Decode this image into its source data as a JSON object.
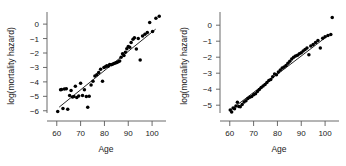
{
  "figure": {
    "background": "#ffffff",
    "point_color": "#000000",
    "line_color": "#000000",
    "axis_color": "#5a5a5a"
  },
  "chart_data": [
    {
      "type": "scatter",
      "panel": "left",
      "title": "",
      "xlabel": "Age",
      "ylabel": "log(mortality hazard)",
      "xlim": [
        58,
        105
      ],
      "ylim": [
        -6.5,
        0.7
      ],
      "xticks": [
        60,
        70,
        80,
        90,
        100
      ],
      "xticklabels": [
        "60",
        "70",
        "80",
        "90",
        "100"
      ],
      "yticks": [
        0,
        -1,
        -2,
        -3,
        -4,
        -5,
        -6
      ],
      "yticklabels": [
        "0",
        "-1",
        "-2",
        "-3",
        "-4",
        "-5",
        "-6"
      ],
      "grid": false,
      "legend": null,
      "fit_line": {
        "x": [
          61.0,
          101.5
        ],
        "y": [
          -5.75,
          -0.35
        ],
        "slope": 0.1333,
        "intercept": -13.88
      },
      "x": [
        60.4,
        61.6,
        62.0,
        62.6,
        63.2,
        64.0,
        64.6,
        65.4,
        66.0,
        66.6,
        67.2,
        67.8,
        68.4,
        69.2,
        70.0,
        70.8,
        71.6,
        72.4,
        73.0,
        73.6,
        74.4,
        75.2,
        76.0,
        76.8,
        77.6,
        78.4,
        79.2,
        79.8,
        80.4,
        81.0,
        81.6,
        82.2,
        82.8,
        83.4,
        84.0,
        84.6,
        85.2,
        85.8,
        86.4,
        87.0,
        87.6,
        88.2,
        88.8,
        89.4,
        90.0,
        90.6,
        91.2,
        92.0,
        92.6,
        93.4,
        94.2,
        95.0,
        96.0,
        97.0,
        98.0,
        99.0,
        100.2,
        101.6,
        103.0
      ],
      "y": [
        -6.05,
        -4.55,
        -4.52,
        -5.85,
        -4.5,
        -4.48,
        -5.9,
        -4.95,
        -4.6,
        -5.05,
        -5.02,
        -4.3,
        -5.08,
        -4.98,
        -4.1,
        -4.95,
        -4.55,
        -5.02,
        -5.75,
        -5.0,
        -4.22,
        -3.95,
        -3.6,
        -3.5,
        -3.35,
        -3.12,
        -3.95,
        -3.0,
        -2.95,
        -2.88,
        -2.92,
        -2.8,
        -2.82,
        -2.78,
        -2.72,
        -2.7,
        -2.66,
        -2.6,
        -2.55,
        -2.3,
        -2.05,
        -2.18,
        -1.95,
        -1.7,
        -1.55,
        -1.6,
        -1.28,
        -1.05,
        -0.95,
        -1.72,
        -1.0,
        -2.48,
        -0.82,
        -0.7,
        -0.58,
        0.12,
        -0.52,
        0.4,
        0.55
      ]
    },
    {
      "type": "scatter",
      "panel": "right",
      "title": "",
      "xlabel": "Age",
      "ylabel": "log(mortality hazard)",
      "xlim": [
        58,
        105
      ],
      "ylim": [
        -5.8,
        0.7
      ],
      "xticks": [
        60,
        70,
        80,
        90,
        100
      ],
      "xticklabels": [
        "60",
        "70",
        "80",
        "90",
        "100"
      ],
      "yticks": [
        0,
        -1,
        -2,
        -3,
        -4,
        -5
      ],
      "yticklabels": [
        "0",
        "-1",
        "-2",
        "-3",
        "-4",
        "-5"
      ],
      "grid": false,
      "legend": null,
      "fit_line": {
        "x": [
          60.5,
          101.5
        ],
        "y": [
          -5.28,
          -0.62
        ],
        "slope": 0.1137,
        "intercept": -12.16
      },
      "x": [
        60.2,
        60.8,
        61.4,
        62.0,
        62.6,
        63.2,
        63.8,
        64.4,
        65.2,
        66.0,
        66.8,
        67.6,
        68.4,
        69.2,
        70.0,
        70.8,
        71.6,
        72.4,
        73.2,
        74.0,
        74.8,
        75.6,
        76.4,
        77.2,
        78.0,
        78.8,
        79.6,
        80.4,
        81.2,
        82.0,
        82.8,
        83.6,
        84.4,
        85.2,
        86.0,
        86.8,
        87.6,
        88.4,
        89.2,
        90.0,
        90.8,
        91.6,
        92.4,
        93.2,
        94.0,
        95.0,
        96.0,
        97.0,
        98.0,
        99.0,
        100.0,
        101.2,
        102.4,
        103.0
      ],
      "y": [
        -5.3,
        -5.42,
        -5.18,
        -5.22,
        -5.05,
        -4.82,
        -5.08,
        -5.1,
        -4.95,
        -4.8,
        -4.72,
        -4.58,
        -4.5,
        -4.45,
        -4.35,
        -4.28,
        -4.15,
        -4.02,
        -3.9,
        -3.8,
        -3.7,
        -3.58,
        -3.45,
        -3.4,
        -3.22,
        -3.05,
        -3.1,
        -2.92,
        -2.8,
        -2.68,
        -2.62,
        -2.52,
        -2.38,
        -2.25,
        -2.12,
        -2.0,
        -1.92,
        -1.88,
        -1.78,
        -1.72,
        -1.62,
        -1.52,
        -1.42,
        -1.85,
        -1.3,
        -1.2,
        -1.08,
        -0.95,
        -1.42,
        -0.82,
        -0.72,
        -0.65,
        -0.58,
        0.48
      ]
    }
  ]
}
